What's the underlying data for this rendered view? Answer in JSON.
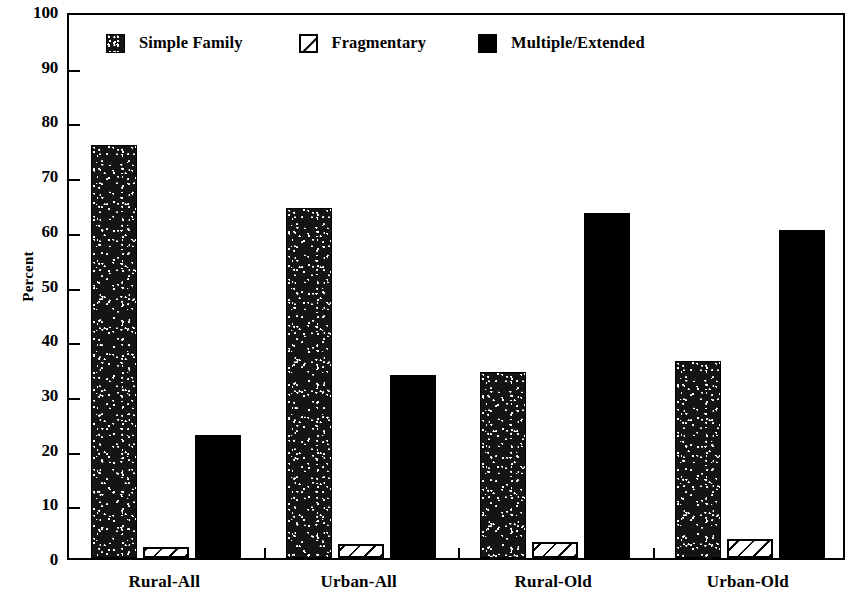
{
  "chart_data": {
    "type": "bar",
    "title": "",
    "subtitle": "",
    "xlabel": "",
    "ylabel": "Percent",
    "ylim": [
      0,
      100
    ],
    "ytick_step": 10,
    "yticks": [
      0,
      10,
      20,
      30,
      40,
      50,
      60,
      70,
      80,
      90,
      100
    ],
    "ytick_labels": [
      "0",
      "10",
      "20",
      "30",
      "40",
      "50",
      "60",
      "70",
      "80",
      "90",
      "100"
    ],
    "grid": false,
    "legend_position": "top-left-inside",
    "categories": [
      "Rural-All",
      "Urban-All",
      "Rural-Old",
      "Urban-Old"
    ],
    "series": [
      {
        "name": "Simple Family",
        "fill": "stipple-dark",
        "color": "#141414",
        "values": [
          75.5,
          64.0,
          34.0,
          36.0
        ]
      },
      {
        "name": "Fragmentary",
        "fill": "diagonal-hatch-white",
        "color": "#ffffff",
        "values": [
          2.0,
          2.5,
          3.0,
          3.5
        ]
      },
      {
        "name": "Multiple/Extended",
        "fill": "solid-black",
        "color": "#000000",
        "values": [
          22.5,
          33.4,
          63.0,
          60.0
        ]
      }
    ]
  },
  "legend": {
    "entries": [
      {
        "label": "Simple Family",
        "swatch": "stipple-swatch-icon"
      },
      {
        "label": "Fragmentary",
        "swatch": "hatched-swatch-icon"
      },
      {
        "label": "Multiple/Extended",
        "swatch": "solid-black-swatch-icon"
      }
    ]
  },
  "axes": {
    "y_title": "Percent"
  }
}
